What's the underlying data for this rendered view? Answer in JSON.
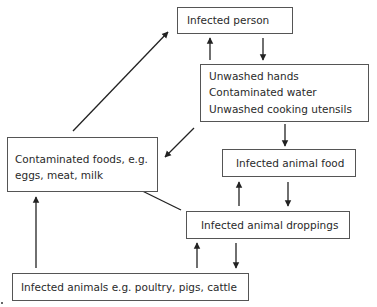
{
  "diagram": {
    "type": "flow-cycle",
    "nodes": {
      "infected_person": {
        "lines": [
          "Infected person"
        ]
      },
      "transmission": {
        "lines": [
          "Unwashed hands",
          "Contaminated water",
          "Unwashed cooking utensils"
        ]
      },
      "contaminated_foods": {
        "lines": [
          "Contaminated foods, e.g.",
          "eggs, meat, milk"
        ]
      },
      "animal_food": {
        "lines": [
          "Infected animal food"
        ]
      },
      "animal_droppings": {
        "lines": [
          "Infected animal droppings"
        ]
      },
      "infected_animals": {
        "lines": [
          "Infected animals e.g. poultry, pigs, cattle"
        ]
      }
    },
    "edges": [
      {
        "from": "transmission",
        "to": "infected_person"
      },
      {
        "from": "infected_person",
        "to": "transmission"
      },
      {
        "from": "transmission",
        "to": "animal_food"
      },
      {
        "from": "transmission",
        "to": "contaminated_foods"
      },
      {
        "from": "contaminated_foods",
        "to": "infected_person"
      },
      {
        "from": "animal_droppings",
        "to": "animal_food"
      },
      {
        "from": "animal_food",
        "to": "animal_droppings"
      },
      {
        "from": "animal_droppings",
        "to": "contaminated_foods"
      },
      {
        "from": "infected_animals",
        "to": "animal_droppings"
      },
      {
        "from": "animal_droppings",
        "to": "infected_animals"
      },
      {
        "from": "infected_animals",
        "to": "contaminated_foods"
      }
    ]
  }
}
